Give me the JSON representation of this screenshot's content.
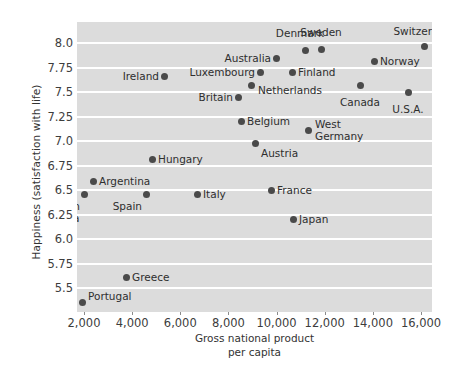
{
  "chart_data": {
    "type": "scatter",
    "title": "",
    "xlabel": "Gross national product\nper capita",
    "xlabel_line1": "Gross national product",
    "xlabel_line2": "per capita",
    "ylabel": "Happiness (satisfaction with life)",
    "xlim": [
      1400,
      16800
    ],
    "ylim": [
      5.5,
      8.12
    ],
    "grid": "horizontal-white-on-gray",
    "legend": "none",
    "xticks": [
      2000,
      4000,
      6000,
      8000,
      10000,
      12000,
      14000,
      16000
    ],
    "xtick_labels": [
      "2,000",
      "4,000",
      "6,000",
      "8,000",
      "10,000",
      "12,000",
      "14,000",
      "16,000"
    ],
    "yticks": [
      5.5,
      5.75,
      6.0,
      6.25,
      6.5,
      6.75,
      7.0,
      7.25,
      7.5,
      7.75,
      8.0
    ],
    "ytick_labels": [
      "5.5",
      "5.75",
      "6.0",
      "6.25",
      "6.5",
      "6.75",
      "7.0",
      "7.25",
      "7.5",
      "7.75",
      "8.0"
    ],
    "points": [
      {
        "label": "Switzerland",
        "x": 16100,
        "y": 7.98,
        "lx": 424,
        "ly": 46,
        "tx": 424,
        "ty": 37,
        "pos": "above"
      },
      {
        "label": "Sweden",
        "x": 11700,
        "y": 7.97,
        "lx": 321,
        "ly": 49,
        "tx": 321,
        "ty": 38,
        "pos": "above"
      },
      {
        "label": "Denmark",
        "x": 11200,
        "y": 7.96,
        "lx": 305,
        "ly": 50,
        "tx": 300,
        "ty": 39,
        "pos": "above"
      },
      {
        "label": "Australia",
        "x": 10000,
        "y": 7.88,
        "lx": 276,
        "ly": 58,
        "tx": 271,
        "ty": 58,
        "pos": "left"
      },
      {
        "label": "Norway",
        "x": 14000,
        "y": 7.84,
        "lx": 374,
        "ly": 61,
        "tx": 380,
        "ty": 61,
        "pos": "right"
      },
      {
        "label": "Luxembourg",
        "x": 9300,
        "y": 7.74,
        "lx": 260,
        "ly": 72,
        "tx": 255,
        "ty": 72,
        "pos": "left"
      },
      {
        "label": "Finland",
        "x": 10700,
        "y": 7.74,
        "lx": 292,
        "ly": 72,
        "tx": 298,
        "ty": 72,
        "pos": "right"
      },
      {
        "label": "Ireland",
        "x": 5200,
        "y": 7.68,
        "lx": 164,
        "ly": 76,
        "tx": 159,
        "ty": 76,
        "pos": "left"
      },
      {
        "label": "Netherlands",
        "x": 8900,
        "y": 7.63,
        "lx": 251,
        "ly": 85,
        "tx": 258,
        "ty": 90,
        "pos": "right-low"
      },
      {
        "label": "Canada",
        "x": 13400,
        "y": 7.62,
        "lx": 360,
        "ly": 85,
        "tx": 360,
        "ty": 96,
        "pos": "below"
      },
      {
        "label": "U.S.A.",
        "x": 15400,
        "y": 7.55,
        "lx": 408,
        "ly": 92,
        "tx": 408,
        "ty": 103,
        "pos": "below"
      },
      {
        "label": "Britain",
        "x": 8500,
        "y": 7.51,
        "lx": 238,
        "ly": 97,
        "tx": 233,
        "ty": 97,
        "pos": "left"
      },
      {
        "label": "Belgium",
        "x": 8700,
        "y": 7.29,
        "lx": 241,
        "ly": 121,
        "tx": 247,
        "ty": 121,
        "pos": "right"
      },
      {
        "label": "West\nGermany",
        "x": 11300,
        "y": 7.21,
        "lx": 308,
        "ly": 130,
        "tx": 315,
        "ty": 130,
        "pos": "right-two-line"
      },
      {
        "label": "Austria",
        "x": 9200,
        "y": 7.1,
        "lx": 255,
        "ly": 143,
        "tx": 261,
        "ty": 153,
        "pos": "below-right"
      },
      {
        "label": "Hungary",
        "x": 5000,
        "y": 6.93,
        "lx": 152,
        "ly": 159,
        "tx": 158,
        "ty": 159,
        "pos": "right"
      },
      {
        "label": "Argentina",
        "x": 2600,
        "y": 6.74,
        "lx": 93,
        "ly": 181,
        "tx": 99,
        "ty": 181,
        "pos": "right"
      },
      {
        "label": "France",
        "x": 9800,
        "y": 6.63,
        "lx": 271,
        "ly": 190,
        "tx": 277,
        "ty": 190,
        "pos": "right"
      },
      {
        "label": "South\nAfrica",
        "x": 2000,
        "y": 6.59,
        "lx": 84,
        "ly": 194,
        "tx": 80,
        "ty": 200,
        "pos": "below-two-line"
      },
      {
        "label": "Spain",
        "x": 4650,
        "y": 6.59,
        "lx": 146,
        "ly": 194,
        "tx": 142,
        "ty": 200,
        "pos": "below-left"
      },
      {
        "label": "Italy",
        "x": 6700,
        "y": 6.59,
        "lx": 197,
        "ly": 194,
        "tx": 203,
        "ty": 194,
        "pos": "right"
      },
      {
        "label": "Japan",
        "x": 10900,
        "y": 6.34,
        "lx": 293,
        "ly": 219,
        "tx": 299,
        "ty": 219,
        "pos": "right"
      },
      {
        "label": "Greece",
        "x": 3750,
        "y": 5.82,
        "lx": 126,
        "ly": 277,
        "tx": 132,
        "ty": 277,
        "pos": "right"
      },
      {
        "label": "Portugal",
        "x": 1900,
        "y": 5.58,
        "lx": 82,
        "ly": 302,
        "tx": 88,
        "ty": 296,
        "pos": "above-right"
      }
    ]
  },
  "colors": {
    "plot_background": "#dcdcdc",
    "gridline": "#ffffff",
    "dot": "#4a4a4a",
    "text": "#3a3a3a",
    "page_background": "#ffffff"
  }
}
